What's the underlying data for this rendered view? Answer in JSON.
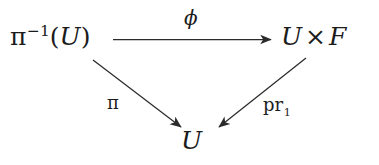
{
  "diagram": {
    "kind": "commutative-triangle",
    "background_color": "#ffffff",
    "stroke_color": "#2b2b2b",
    "nodes": {
      "source": {
        "base": "π",
        "exponent": "−1",
        "open_paren": "(",
        "arg": "U",
        "close_paren": ")",
        "full_text": "π⁻¹(U)"
      },
      "target": {
        "left": "U",
        "operator": "×",
        "right": "F",
        "full_text": "U × F"
      },
      "base": {
        "text": "U"
      }
    },
    "edges": {
      "top": {
        "label": "ϕ",
        "from": "source",
        "to": "target",
        "direction": "right"
      },
      "left": {
        "label": "π",
        "from": "source",
        "to": "base",
        "direction": "down-right"
      },
      "right": {
        "label_base": "pr",
        "label_subscript": "1",
        "label_full": "pr₁",
        "from": "target",
        "to": "base",
        "direction": "down-left"
      }
    }
  }
}
